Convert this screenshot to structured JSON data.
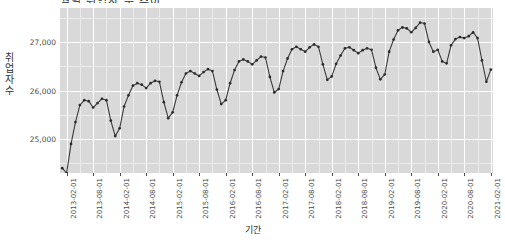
{
  "chart_title": "월별 취업자 수 추이",
  "axis": {
    "x_title": "기간",
    "y_title": "취업자 수",
    "y_ticks": [
      "25,000",
      "26,000",
      "27,000"
    ],
    "y_tick_values": [
      25000,
      26000,
      27000
    ],
    "x_ticks": [
      "2013-02-01",
      "2013-08-01",
      "2014-02-01",
      "2014-08-01",
      "2015-02-01",
      "2015-08-01",
      "2016-02-01",
      "2016-08-01",
      "2017-02-01",
      "2017-08-01",
      "2018-02-01",
      "2018-08-01",
      "2019-02-01",
      "2019-08-01",
      "2020-02-01",
      "2020-08-01",
      "2021-02-01"
    ]
  },
  "style": {
    "panel_bg": "#d9d9d9",
    "grid_major": "#ffffff",
    "grid_minor": "#ececec",
    "line_color": "#3a3a3a",
    "point_color": "#2b2b2b",
    "axis_text": "#4d4d4d"
  },
  "chart_data": {
    "type": "line",
    "title": "월별 취업자 수 추이",
    "xlabel": "기간",
    "ylabel": "취업자 수",
    "xlim": [
      "2013-01-01",
      "2021-02-01"
    ],
    "ylim": [
      24300,
      27700
    ],
    "grid": true,
    "legend": "none",
    "markers": true,
    "x": [
      "2013-01-01",
      "2013-02-01",
      "2013-03-01",
      "2013-04-01",
      "2013-05-01",
      "2013-06-01",
      "2013-07-01",
      "2013-08-01",
      "2013-09-01",
      "2013-10-01",
      "2013-11-01",
      "2013-12-01",
      "2014-01-01",
      "2014-02-01",
      "2014-03-01",
      "2014-04-01",
      "2014-05-01",
      "2014-06-01",
      "2014-07-01",
      "2014-08-01",
      "2014-09-01",
      "2014-10-01",
      "2014-11-01",
      "2014-12-01",
      "2015-01-01",
      "2015-02-01",
      "2015-03-01",
      "2015-04-01",
      "2015-05-01",
      "2015-06-01",
      "2015-07-01",
      "2015-08-01",
      "2015-09-01",
      "2015-10-01",
      "2015-11-01",
      "2015-12-01",
      "2016-01-01",
      "2016-02-01",
      "2016-03-01",
      "2016-04-01",
      "2016-05-01",
      "2016-06-01",
      "2016-07-01",
      "2016-08-01",
      "2016-09-01",
      "2016-10-01",
      "2016-11-01",
      "2016-12-01",
      "2017-01-01",
      "2017-02-01",
      "2017-03-01",
      "2017-04-01",
      "2017-05-01",
      "2017-06-01",
      "2017-07-01",
      "2017-08-01",
      "2017-09-01",
      "2017-10-01",
      "2017-11-01",
      "2017-12-01",
      "2018-01-01",
      "2018-02-01",
      "2018-03-01",
      "2018-04-01",
      "2018-05-01",
      "2018-06-01",
      "2018-07-01",
      "2018-08-01",
      "2018-09-01",
      "2018-10-01",
      "2018-11-01",
      "2018-12-01",
      "2019-01-01",
      "2019-02-01",
      "2019-03-01",
      "2019-04-01",
      "2019-05-01",
      "2019-06-01",
      "2019-07-01",
      "2019-08-01",
      "2019-09-01",
      "2019-10-01",
      "2019-11-01",
      "2019-12-01",
      "2020-01-01",
      "2020-02-01",
      "2020-03-01",
      "2020-04-01",
      "2020-05-01",
      "2020-06-01",
      "2020-07-01",
      "2020-08-01",
      "2020-09-01",
      "2020-10-01",
      "2020-11-01",
      "2020-12-01",
      "2021-01-01",
      "2021-02-01"
    ],
    "series": [
      {
        "name": "취업자 수",
        "values": [
          24400,
          24300,
          24900,
          25350,
          25700,
          25800,
          25780,
          25650,
          25740,
          25830,
          25800,
          25380,
          25060,
          25220,
          25670,
          25900,
          26100,
          26150,
          26120,
          26050,
          26150,
          26200,
          26180,
          25760,
          25430,
          25550,
          25900,
          26170,
          26350,
          26400,
          26350,
          26300,
          26380,
          26440,
          26400,
          26020,
          25720,
          25800,
          26150,
          26420,
          26600,
          26640,
          26600,
          26540,
          26620,
          26700,
          26680,
          26280,
          25960,
          26030,
          26400,
          26660,
          26850,
          26900,
          26850,
          26800,
          26890,
          26950,
          26900,
          26540,
          26220,
          26290,
          26550,
          26720,
          26870,
          26890,
          26830,
          26770,
          26830,
          26870,
          26840,
          26470,
          26230,
          26330,
          26800,
          27050,
          27240,
          27300,
          27280,
          27200,
          27290,
          27400,
          27380,
          27000,
          26800,
          26840,
          26600,
          26560,
          26930,
          27060,
          27100,
          27080,
          27120,
          27200,
          27080,
          26620,
          26180,
          26430
        ]
      }
    ]
  }
}
